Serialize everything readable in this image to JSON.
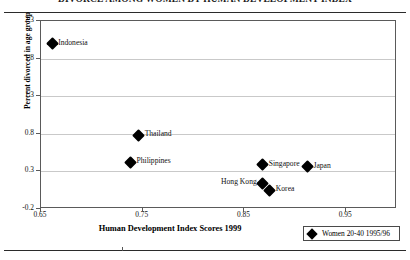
{
  "figure": {
    "title": "DIVORCE AMONG WOMEN BY HUMAN DEVELOPMENT INDEX"
  },
  "chart_data": {
    "type": "scatter",
    "title": "DIVORCE AMONG WOMEN BY HUMAN DEVELOPMENT INDEX",
    "xlabel": "Human Development Index Scores 1999",
    "ylabel": "Percent divorced in age group",
    "xlim": [
      0.65,
      1.0
    ],
    "ylim": [
      -0.2,
      2.3
    ],
    "xticks": [
      "0.65",
      "0.75",
      "0.85",
      "0.95"
    ],
    "xtick_values": [
      0.65,
      0.75,
      0.85,
      0.95
    ],
    "yticks": [
      "2.3",
      "1.8",
      "1.3",
      "0.8",
      "0.3",
      "-0.2"
    ],
    "ytick_values": [
      2.3,
      1.8,
      1.3,
      0.8,
      0.3,
      -0.2
    ],
    "grid": "horizontal",
    "legend_position": "below-right",
    "legend": [
      {
        "label": "Women 20-40 1995/96",
        "marker": "filled-diamond",
        "color": "#000000"
      }
    ],
    "series": [
      {
        "name": "Women 20-40 1995/96",
        "marker": "filled-diamond",
        "color": "#000000",
        "points": [
          {
            "label": "Indonesia",
            "x": 0.661,
            "y": 2.0,
            "label_side": "right"
          },
          {
            "label": "Thailand",
            "x": 0.746,
            "y": 0.78,
            "label_side": "right"
          },
          {
            "label": "Philippines",
            "x": 0.738,
            "y": 0.42,
            "label_side": "right"
          },
          {
            "label": "Singapore",
            "x": 0.868,
            "y": 0.39,
            "label_side": "right"
          },
          {
            "label": "Japan",
            "x": 0.912,
            "y": 0.36,
            "label_side": "right"
          },
          {
            "label": "Hong Kong",
            "x": 0.868,
            "y": 0.14,
            "label_side": "left"
          },
          {
            "label": "Korea",
            "x": 0.875,
            "y": 0.05,
            "label_side": "right"
          }
        ]
      }
    ]
  }
}
